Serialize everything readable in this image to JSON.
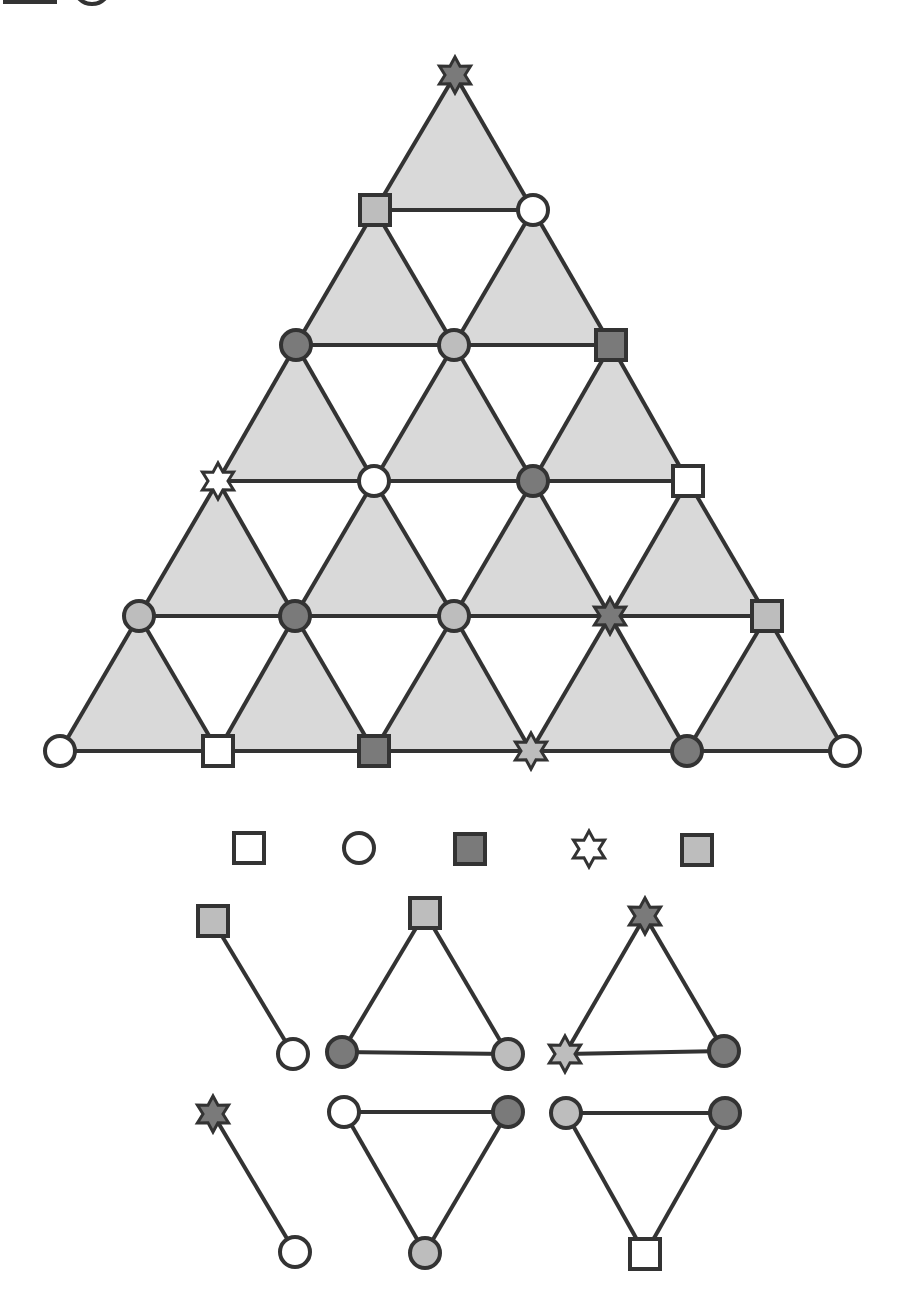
{
  "colors": {
    "stroke": "#333333",
    "tri_fill": "#d9d9d9",
    "white": "#ffffff",
    "light": "#bdbdbd",
    "dark": "#7a7a7a"
  },
  "main_triangle": {
    "rows": [
      {
        "y": 75,
        "nodes": [
          {
            "x": 455,
            "shape": "star",
            "fill": "dark"
          }
        ]
      },
      {
        "y": 210,
        "nodes": [
          {
            "x": 375,
            "shape": "square",
            "fill": "light"
          },
          {
            "x": 533,
            "shape": "circle",
            "fill": "white"
          }
        ]
      },
      {
        "y": 345,
        "nodes": [
          {
            "x": 296,
            "shape": "circle",
            "fill": "dark"
          },
          {
            "x": 454,
            "shape": "circle",
            "fill": "light"
          },
          {
            "x": 611,
            "shape": "square",
            "fill": "dark"
          }
        ]
      },
      {
        "y": 481,
        "nodes": [
          {
            "x": 218,
            "shape": "star",
            "fill": "white"
          },
          {
            "x": 374,
            "shape": "circle",
            "fill": "white"
          },
          {
            "x": 533,
            "shape": "circle",
            "fill": "dark"
          },
          {
            "x": 688,
            "shape": "square",
            "fill": "white"
          }
        ]
      },
      {
        "y": 616,
        "nodes": [
          {
            "x": 139,
            "shape": "circle",
            "fill": "light"
          },
          {
            "x": 295,
            "shape": "circle",
            "fill": "dark"
          },
          {
            "x": 454,
            "shape": "circle",
            "fill": "light"
          },
          {
            "x": 610,
            "shape": "star",
            "fill": "dark"
          },
          {
            "x": 767,
            "shape": "square",
            "fill": "light"
          }
        ]
      },
      {
        "y": 751,
        "nodes": [
          {
            "x": 60,
            "shape": "circle",
            "fill": "white"
          },
          {
            "x": 218,
            "shape": "square",
            "fill": "white"
          },
          {
            "x": 374,
            "shape": "square",
            "fill": "dark"
          },
          {
            "x": 531,
            "shape": "star",
            "fill": "light"
          },
          {
            "x": 687,
            "shape": "circle",
            "fill": "dark"
          },
          {
            "x": 845,
            "shape": "circle",
            "fill": "white"
          }
        ]
      }
    ]
  },
  "legend": [
    {
      "x": 249,
      "y": 848,
      "shape": "square",
      "fill": "white"
    },
    {
      "x": 359,
      "y": 848,
      "shape": "circle",
      "fill": "white"
    },
    {
      "x": 470,
      "y": 849,
      "shape": "square",
      "fill": "dark"
    },
    {
      "x": 589,
      "y": 849,
      "shape": "star",
      "fill": "white"
    },
    {
      "x": 697,
      "y": 850,
      "shape": "square",
      "fill": "light"
    }
  ],
  "small_graphs": [
    {
      "nodes": [
        {
          "x": 213,
          "y": 921,
          "shape": "square",
          "fill": "light"
        },
        {
          "x": 293,
          "y": 1054,
          "shape": "circle",
          "fill": "white"
        }
      ],
      "edges": [
        [
          0,
          1
        ]
      ]
    },
    {
      "nodes": [
        {
          "x": 425,
          "y": 913,
          "shape": "square",
          "fill": "light"
        },
        {
          "x": 342,
          "y": 1052,
          "shape": "circle",
          "fill": "dark"
        },
        {
          "x": 508,
          "y": 1054,
          "shape": "circle",
          "fill": "light"
        }
      ],
      "edges": [
        [
          0,
          1
        ],
        [
          0,
          2
        ],
        [
          1,
          2
        ]
      ]
    },
    {
      "nodes": [
        {
          "x": 645,
          "y": 916,
          "shape": "star",
          "fill": "dark"
        },
        {
          "x": 565,
          "y": 1054,
          "shape": "star",
          "fill": "light"
        },
        {
          "x": 724,
          "y": 1051,
          "shape": "circle",
          "fill": "dark"
        }
      ],
      "edges": [
        [
          0,
          1
        ],
        [
          0,
          2
        ],
        [
          1,
          2
        ]
      ]
    },
    {
      "nodes": [
        {
          "x": 213,
          "y": 1114,
          "shape": "star",
          "fill": "dark"
        },
        {
          "x": 295,
          "y": 1252,
          "shape": "circle",
          "fill": "white"
        }
      ],
      "edges": [
        [
          0,
          1
        ]
      ]
    },
    {
      "nodes": [
        {
          "x": 344,
          "y": 1112,
          "shape": "circle",
          "fill": "white"
        },
        {
          "x": 508,
          "y": 1112,
          "shape": "circle",
          "fill": "dark"
        },
        {
          "x": 425,
          "y": 1253,
          "shape": "circle",
          "fill": "light"
        }
      ],
      "edges": [
        [
          0,
          1
        ],
        [
          0,
          2
        ],
        [
          1,
          2
        ]
      ]
    },
    {
      "nodes": [
        {
          "x": 566,
          "y": 1113,
          "shape": "circle",
          "fill": "light"
        },
        {
          "x": 725,
          "y": 1113,
          "shape": "circle",
          "fill": "dark"
        },
        {
          "x": 645,
          "y": 1254,
          "shape": "square",
          "fill": "white"
        }
      ],
      "edges": [
        [
          0,
          1
        ],
        [
          0,
          2
        ],
        [
          1,
          2
        ]
      ]
    }
  ],
  "top_left_fragment": [
    {
      "x": 30,
      "shape": "square",
      "fill": "dark"
    },
    {
      "x": 92,
      "shape": "circle",
      "fill": "white"
    }
  ]
}
